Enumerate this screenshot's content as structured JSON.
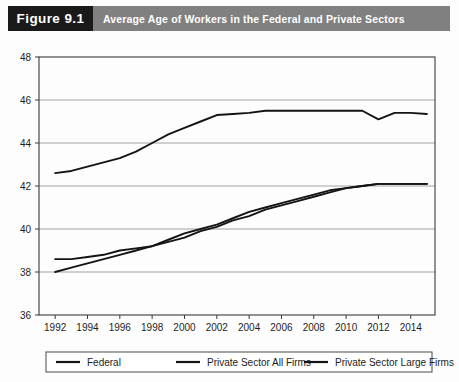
{
  "header": {
    "figure_number": "Figure 9.1",
    "title": "Average Age of Workers in the Federal and Private Sectors"
  },
  "chart_data": {
    "type": "line",
    "title": "Average Age of Workers in the Federal and Private Sectors",
    "xlabel": "",
    "ylabel": "",
    "xlim": [
      1991,
      2015.5
    ],
    "ylim": [
      36,
      48
    ],
    "yticks": [
      36,
      38,
      40,
      42,
      44,
      46,
      48
    ],
    "ytick_labels": [
      "36",
      "38",
      "40",
      "42",
      "44",
      "46",
      "48"
    ],
    "xticks": [
      1992,
      1994,
      1996,
      1998,
      2000,
      2002,
      2004,
      2006,
      2008,
      2010,
      2012,
      2014
    ],
    "xtick_labels": [
      "1992",
      "1994",
      "1996",
      "1998",
      "2000",
      "2002",
      "2004",
      "2006",
      "2008",
      "2010",
      "2012",
      "2014"
    ],
    "grid": true,
    "grid_axis": "y",
    "legend_position": "below",
    "x": [
      1992,
      1993,
      1994,
      1995,
      1996,
      1997,
      1998,
      1999,
      2000,
      2001,
      2002,
      2003,
      2004,
      2005,
      2006,
      2007,
      2008,
      2009,
      2010,
      2011,
      2012,
      2013,
      2014,
      2015
    ],
    "series": [
      {
        "name": "Federal",
        "color": "#141414",
        "values": [
          42.6,
          42.7,
          42.9,
          43.1,
          43.3,
          43.6,
          44.0,
          44.4,
          44.7,
          45.0,
          45.3,
          45.35,
          45.4,
          45.5,
          45.5,
          45.5,
          45.5,
          45.5,
          45.5,
          45.5,
          45.1,
          45.4,
          45.4,
          45.35
        ]
      },
      {
        "name": "Private Sector All Firms",
        "color": "#141414",
        "values": [
          38.6,
          38.6,
          38.7,
          38.8,
          39.0,
          39.1,
          39.2,
          39.5,
          39.8,
          40.0,
          40.2,
          40.5,
          40.8,
          41.0,
          41.2,
          41.4,
          41.6,
          41.8,
          41.9,
          42.0,
          42.1,
          42.1,
          42.1,
          42.1
        ]
      },
      {
        "name": "Private Sector Large Firms",
        "color": "#141414",
        "values": [
          38.0,
          38.2,
          38.4,
          38.6,
          38.8,
          39.0,
          39.2,
          39.4,
          39.6,
          39.9,
          40.1,
          40.4,
          40.6,
          40.9,
          41.1,
          41.3,
          41.5,
          41.7,
          41.9,
          42.0,
          42.1,
          42.1,
          42.1,
          42.1
        ]
      }
    ]
  }
}
